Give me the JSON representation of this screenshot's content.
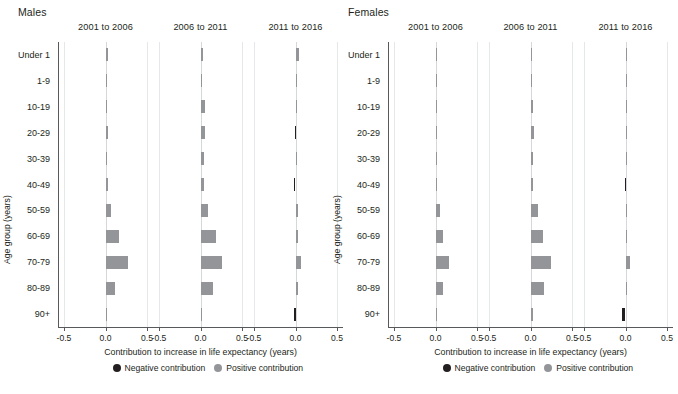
{
  "figure": {
    "xaxis_title": "Contribution to increase in life expectancy (years)",
    "yaxis_title": "Age group (years)",
    "colors": {
      "positive": "#939598",
      "negative": "#231f20",
      "grid": "#e6e7e8",
      "axis": "#58595b"
    }
  },
  "legend": {
    "items": [
      {
        "label": "Negative contribution",
        "color": "#231f20",
        "key": "neg"
      },
      {
        "label": "Positive contribution",
        "color": "#939598",
        "key": "pos"
      }
    ]
  },
  "chart_data": {
    "type": "bar",
    "title": "",
    "xlabel": "Contribution to increase in life expectancy (years)",
    "ylabel": "Age group (years)",
    "xlim": [
      -0.5,
      0.5
    ],
    "xticks": [
      -0.5,
      0.0,
      0.5
    ],
    "xtick_labels": [
      "-0.5",
      "0.0",
      "0.5"
    ],
    "grid": true,
    "orientation": "horizontal",
    "legend_position": "bottom",
    "categories": [
      "Under 1",
      "1-9",
      "10-19",
      "20-29",
      "30-39",
      "40-49",
      "50-59",
      "60-69",
      "70-79",
      "80-89",
      "90+"
    ],
    "panels": [
      {
        "sex": "Males",
        "periods": [
          {
            "label": "2001 to 2006",
            "values": [
              0.03,
              0.008,
              0.022,
              0.03,
              0.022,
              0.03,
              0.07,
              0.16,
              0.27,
              0.115,
              0.005
            ]
          },
          {
            "label": "2006 to 2011",
            "values": [
              0.026,
              0.008,
              0.055,
              0.055,
              0.045,
              0.04,
              0.085,
              0.185,
              0.255,
              0.155,
              0.022
            ]
          },
          {
            "label": "2011 to 2016",
            "values": [
              0.04,
              0.004,
              0.004,
              -0.012,
              0.004,
              -0.018,
              0.028,
              0.03,
              0.062,
              0.028,
              -0.014
            ]
          }
        ]
      },
      {
        "sex": "Females",
        "periods": [
          {
            "label": "2001 to 2006",
            "values": [
              0.02,
              0.004,
              0.004,
              0.008,
              0.02,
              0.02,
              0.06,
              0.095,
              0.16,
              0.09,
              0.012
            ]
          },
          {
            "label": "2006 to 2011",
            "values": [
              0.022,
              0.006,
              0.03,
              0.038,
              0.03,
              0.032,
              0.09,
              0.15,
              0.25,
              0.165,
              0.03
            ]
          },
          {
            "label": "2011 to 2016",
            "values": [
              0.006,
              0.004,
              0.006,
              0.006,
              0.004,
              -0.012,
              0.008,
              0.022,
              0.055,
              0.022,
              -0.042
            ]
          }
        ]
      }
    ]
  }
}
